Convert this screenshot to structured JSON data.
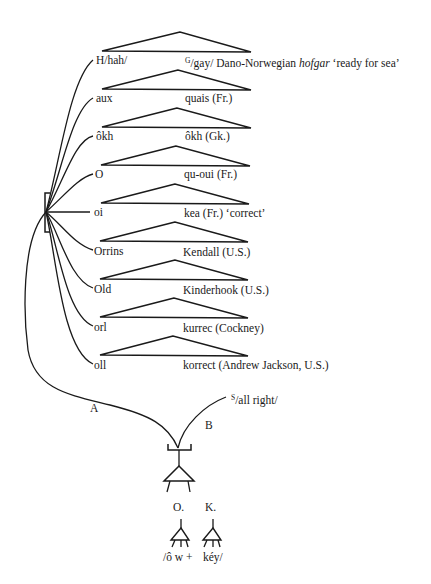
{
  "diagram": {
    "type": "derivation-tree",
    "rows": [
      {
        "left": "H/hah/",
        "right_sup": "G",
        "right": "/gay/ Dano-Norwegian ",
        "right_italic": "hofgar",
        "right_tail": " ‘ready for sea’"
      },
      {
        "left": "aux",
        "right": "quais (Fr.)"
      },
      {
        "left": "ôkh",
        "right": "ôkh (Gk.)"
      },
      {
        "left": "O",
        "right": "qu-oui (Fr.)"
      },
      {
        "left": "oi",
        "right": "kea (Fr.) ‘correct’"
      },
      {
        "left": "Orrins",
        "right": "Kendall (U.S.)"
      },
      {
        "left": "Old",
        "right": "Kinderhook (U.S.)"
      },
      {
        "left": "orl",
        "right": "kurrec (Cockney)"
      },
      {
        "left": "oll",
        "right": "korrect (Andrew Jackson, U.S.)"
      }
    ],
    "branch_a": "A",
    "branch_b": "B",
    "b_sup": "S",
    "b_label": "/all right/",
    "node_o": "O.",
    "node_k": "K.",
    "leaf_o": "/ô w +",
    "leaf_k": "kéy/",
    "line_color": "#1a1a1a"
  }
}
